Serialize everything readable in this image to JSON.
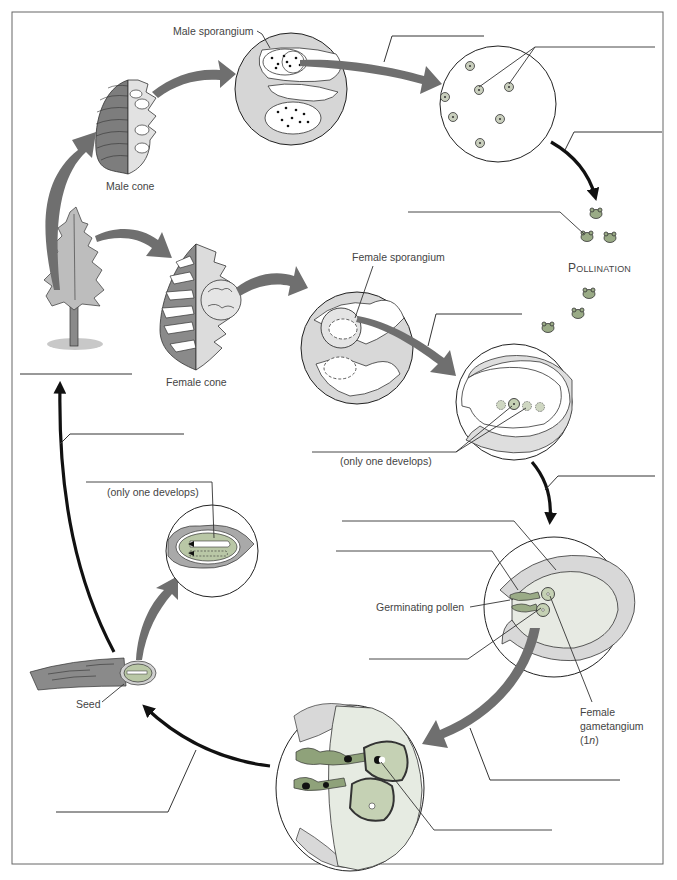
{
  "diagram": {
    "labels": {
      "male_sporangium": "Male sporangium",
      "male_cone": "Male cone",
      "female_sporangium": "Female sporangium",
      "female_cone": "Female cone",
      "pollination_initial": "P",
      "pollination_rest": "OLLINATION",
      "only_one_develops_top": "(only one develops)",
      "only_one_develops_seed": "(only one develops)",
      "germinating_pollen": "Germinating pollen",
      "female_gametangium_line1": "Female",
      "female_gametangium_line2": "gametangium",
      "female_gametangium_line3_pre": "(1",
      "female_gametangium_line3_italic": "n",
      "female_gametangium_line3_post": ")",
      "seed": "Seed"
    },
    "blank_label_lines": [
      {
        "id": "blank-meiosis",
        "note": "line above arrow from male sporangium to spores"
      },
      {
        "id": "blank-microspores",
        "note": "line pointing to microspores"
      },
      {
        "id": "blank-pollen-dispersal",
        "note": "line beside black arrow to pollen grains"
      },
      {
        "id": "blank-pollen-grain",
        "note": "line pointing to a pollen grain"
      },
      {
        "id": "blank-female-meiosis",
        "note": "line above arrow from female sporangium"
      },
      {
        "id": "blank-megaspores",
        "note": "line pointing to megaspores"
      },
      {
        "id": "blank-development",
        "note": "line beside arrow to gametangium stage"
      },
      {
        "id": "blank-female-gametophyte-1",
        "note": "upper line at gametangium circle"
      },
      {
        "id": "blank-female-gametophyte-2",
        "note": "second line at gametangium circle"
      },
      {
        "id": "blank-egg",
        "note": "lower-left line at gametangium circle"
      },
      {
        "id": "blank-fertilization",
        "note": "line beside arrow to fertilization circle"
      },
      {
        "id": "blank-zygote",
        "note": "line pointing to zygote"
      },
      {
        "id": "blank-seed-formation",
        "note": "line beside arrow to seed"
      },
      {
        "id": "blank-embryo",
        "note": "line pointing to embryo"
      },
      {
        "id": "blank-germination",
        "note": "line beside arrow to tree"
      },
      {
        "id": "blank-sporophyte",
        "note": "line under tree"
      }
    ],
    "colors": {
      "arrow_gray": "#6f6f6f",
      "arrow_black": "#111111",
      "tissue_gray": "#d6d6d6",
      "tissue_light": "#e6e8e4",
      "green_cell": "#9aab86",
      "light_green": "#c5d1b4",
      "cone_dark": "#7b7b7b",
      "border": "#555555"
    }
  }
}
